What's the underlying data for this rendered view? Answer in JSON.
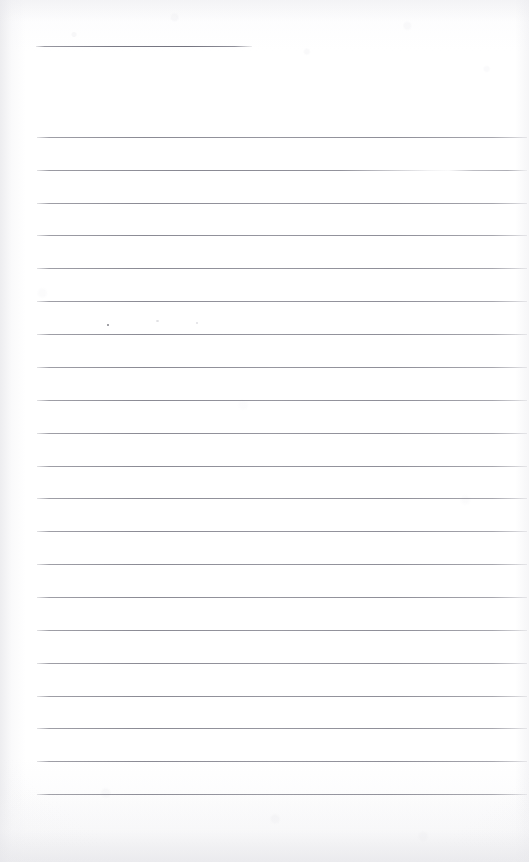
{
  "document": {
    "kind": "scanned-lined-notebook-page",
    "title": "Blank lined notebook page",
    "content_text": "",
    "page_width": 529,
    "page_height": 862,
    "paper_color": "#fdfdfd",
    "rule_color": "#7a7a85",
    "left_margin_x": 37,
    "right_margin_x": 526,
    "rule_spacing": 32.85,
    "rule_count": 21,
    "has_handwriting": false,
    "has_printed_text": false
  },
  "rules": [
    {
      "id": "rule-top-short",
      "y": 46,
      "x1": 36,
      "x2": 252,
      "style": "short"
    },
    {
      "id": "rule-01",
      "y": 137,
      "x1": 37,
      "x2": 527,
      "style": "full"
    },
    {
      "id": "rule-02",
      "y": 170,
      "x1": 37,
      "x2": 527,
      "style": "gapped"
    },
    {
      "id": "rule-03",
      "y": 203,
      "x1": 37,
      "x2": 527,
      "style": "full"
    },
    {
      "id": "rule-04",
      "y": 235,
      "x1": 37,
      "x2": 527,
      "style": "full"
    },
    {
      "id": "rule-05",
      "y": 268,
      "x1": 37,
      "x2": 527,
      "style": "full"
    },
    {
      "id": "rule-06",
      "y": 301,
      "x1": 37,
      "x2": 527,
      "style": "full"
    },
    {
      "id": "rule-07",
      "y": 334,
      "x1": 37,
      "x2": 527,
      "style": "full"
    },
    {
      "id": "rule-08",
      "y": 367,
      "x1": 37,
      "x2": 527,
      "style": "full"
    },
    {
      "id": "rule-09",
      "y": 400,
      "x1": 37,
      "x2": 527,
      "style": "full"
    },
    {
      "id": "rule-10",
      "y": 433,
      "x1": 37,
      "x2": 527,
      "style": "full"
    },
    {
      "id": "rule-11",
      "y": 466,
      "x1": 37,
      "x2": 527,
      "style": "full"
    },
    {
      "id": "rule-12",
      "y": 498,
      "x1": 37,
      "x2": 527,
      "style": "full"
    },
    {
      "id": "rule-13",
      "y": 531,
      "x1": 37,
      "x2": 527,
      "style": "full"
    },
    {
      "id": "rule-14",
      "y": 564,
      "x1": 37,
      "x2": 527,
      "style": "full"
    },
    {
      "id": "rule-15",
      "y": 597,
      "x1": 37,
      "x2": 527,
      "style": "full"
    },
    {
      "id": "rule-16",
      "y": 630,
      "x1": 37,
      "x2": 527,
      "style": "full"
    },
    {
      "id": "rule-17",
      "y": 663,
      "x1": 37,
      "x2": 527,
      "style": "full"
    },
    {
      "id": "rule-18",
      "y": 696,
      "x1": 37,
      "x2": 527,
      "style": "full"
    },
    {
      "id": "rule-19",
      "y": 728,
      "x1": 37,
      "x2": 527,
      "style": "full"
    },
    {
      "id": "rule-20",
      "y": 761,
      "x1": 37,
      "x2": 527,
      "style": "full"
    },
    {
      "id": "rule-21",
      "y": 794,
      "x1": 37,
      "x2": 527,
      "style": "full"
    }
  ],
  "marks": [
    {
      "id": "speck-1",
      "x": 107,
      "y": 324,
      "w": 2,
      "h": 2,
      "kind": "speck"
    },
    {
      "id": "speck-2",
      "x": 156,
      "y": 320,
      "w": 3,
      "h": 2,
      "kind": "faint"
    },
    {
      "id": "speck-3",
      "x": 196,
      "y": 322,
      "w": 2,
      "h": 2,
      "kind": "faint"
    }
  ]
}
